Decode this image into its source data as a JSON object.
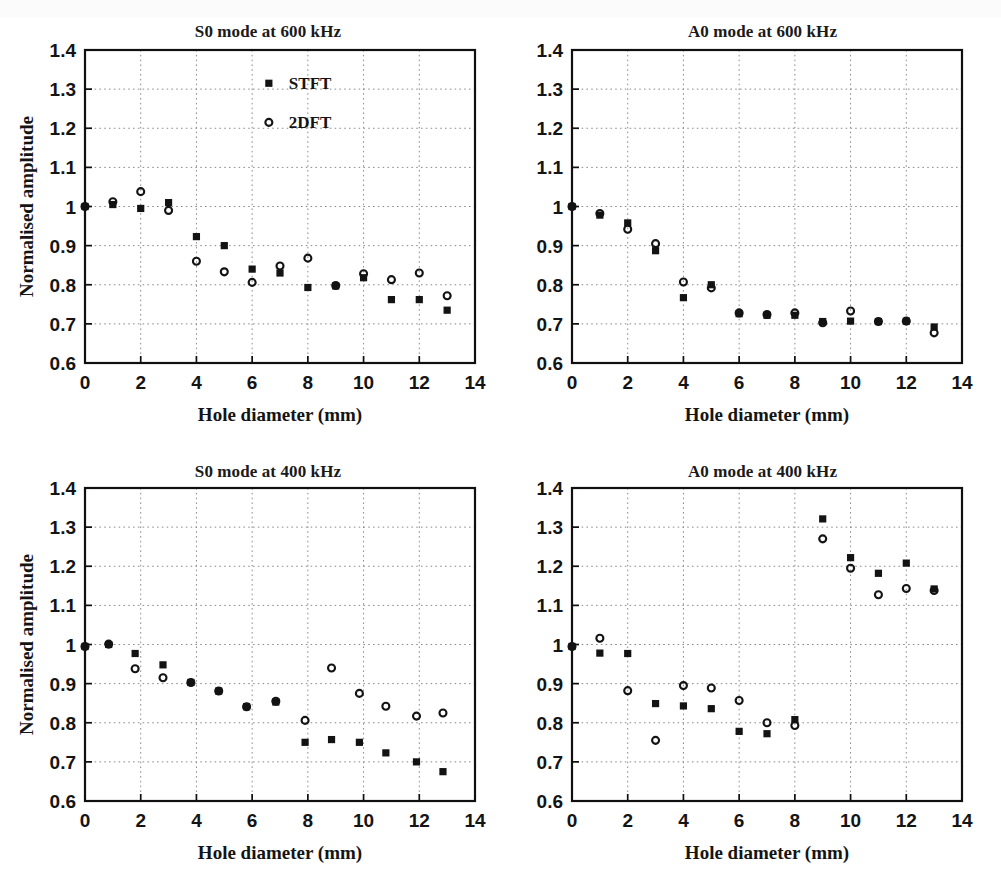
{
  "figure": {
    "axis_labels": {
      "x": "Hole diameter (mm)",
      "y": "Normalised amplitude"
    },
    "legend": {
      "stft": "STFT",
      "dft": "2DFT"
    },
    "xticks": [
      "0",
      "2",
      "4",
      "6",
      "8",
      "10",
      "12",
      "14"
    ],
    "yticks": [
      "0.6",
      "0.7",
      "0.8",
      "0.9",
      "1",
      "1.1",
      "1.2",
      "1.3",
      "1.4"
    ],
    "colors": {
      "ink": "#131313",
      "grid": "#8c8c8c",
      "background": "#ffffff"
    }
  },
  "chart_data": [
    {
      "type": "scatter",
      "panel": "top-left",
      "title": "S0 mode at 600 kHz",
      "xlabel": "Hole diameter (mm)",
      "ylabel": "Normalised amplitude",
      "xlim": [
        0,
        14
      ],
      "ylim": [
        0.6,
        1.4
      ],
      "xticks": [
        0,
        2,
        4,
        6,
        8,
        10,
        12,
        14
      ],
      "yticks": [
        0.6,
        0.7,
        0.8,
        0.9,
        1.0,
        1.1,
        1.2,
        1.3,
        1.4
      ],
      "grid": true,
      "legend_position": "top-right-inside",
      "series": [
        {
          "name": "STFT",
          "marker": "filled-square",
          "x": [
            0,
            1,
            2,
            3,
            4,
            5,
            6,
            7,
            8,
            9,
            10,
            11,
            12,
            13
          ],
          "y": [
            1.0,
            1.005,
            0.995,
            1.01,
            0.923,
            0.9,
            0.84,
            0.83,
            0.793,
            0.797,
            0.818,
            0.762,
            0.762,
            0.735
          ]
        },
        {
          "name": "2DFT",
          "marker": "open-circle",
          "x": [
            0,
            1,
            2,
            3,
            4,
            5,
            6,
            7,
            8,
            9,
            10,
            11,
            12,
            13
          ],
          "y": [
            1.0,
            1.012,
            1.038,
            0.99,
            0.86,
            0.833,
            0.806,
            0.848,
            0.868,
            0.798,
            0.828,
            0.813,
            0.83,
            0.772
          ]
        }
      ]
    },
    {
      "type": "scatter",
      "panel": "top-right",
      "title": "A0 mode at 600 kHz",
      "xlabel": "Hole diameter (mm)",
      "ylabel": "Normalised amplitude",
      "xlim": [
        0,
        14
      ],
      "ylim": [
        0.6,
        1.4
      ],
      "xticks": [
        0,
        2,
        4,
        6,
        8,
        10,
        12,
        14
      ],
      "yticks": [
        0.6,
        0.7,
        0.8,
        0.9,
        1.0,
        1.1,
        1.2,
        1.3,
        1.4
      ],
      "grid": true,
      "legend_position": "none",
      "series": [
        {
          "name": "STFT",
          "marker": "filled-square",
          "x": [
            0,
            1,
            2,
            3,
            4,
            5,
            6,
            7,
            8,
            9,
            10,
            11,
            12,
            13
          ],
          "y": [
            1.0,
            0.978,
            0.958,
            0.887,
            0.767,
            0.8,
            0.726,
            0.722,
            0.722,
            0.706,
            0.707,
            0.706,
            0.707,
            0.692
          ]
        },
        {
          "name": "2DFT",
          "marker": "open-circle",
          "x": [
            0,
            1,
            2,
            3,
            4,
            5,
            6,
            7,
            8,
            9,
            10,
            11,
            12,
            13
          ],
          "y": [
            1.0,
            0.982,
            0.942,
            0.905,
            0.807,
            0.792,
            0.728,
            0.724,
            0.728,
            0.703,
            0.733,
            0.706,
            0.707,
            0.677
          ]
        }
      ]
    },
    {
      "type": "scatter",
      "panel": "bottom-left",
      "title": "S0 mode at 400 kHz",
      "xlabel": "Hole diameter (mm)",
      "ylabel": "Normalised amplitude",
      "xlim": [
        0,
        14
      ],
      "ylim": [
        0.6,
        1.4
      ],
      "xticks": [
        0,
        2,
        4,
        6,
        8,
        10,
        12,
        14
      ],
      "yticks": [
        0.6,
        0.7,
        0.8,
        0.9,
        1.0,
        1.1,
        1.2,
        1.3,
        1.4
      ],
      "grid": true,
      "legend_position": "none",
      "series": [
        {
          "name": "STFT",
          "marker": "filled-square",
          "x": [
            0,
            0.85,
            1.8,
            2.8,
            3.8,
            4.8,
            5.8,
            6.85,
            7.9,
            8.85,
            9.85,
            10.8,
            11.9,
            12.85
          ],
          "y": [
            0.995,
            1.0,
            0.977,
            0.948,
            0.903,
            0.881,
            0.841,
            0.853,
            0.75,
            0.757,
            0.75,
            0.723,
            0.7,
            0.675
          ]
        },
        {
          "name": "2DFT",
          "marker": "open-circle",
          "x": [
            0,
            0.85,
            1.8,
            2.8,
            3.8,
            4.8,
            5.8,
            6.85,
            7.9,
            8.85,
            9.85,
            10.8,
            11.9,
            12.85
          ],
          "y": [
            0.995,
            1.001,
            0.938,
            0.915,
            0.903,
            0.881,
            0.841,
            0.855,
            0.806,
            0.94,
            0.875,
            0.842,
            0.817,
            0.825
          ]
        }
      ]
    },
    {
      "type": "scatter",
      "panel": "bottom-right",
      "title": "A0 mode at 400 kHz",
      "xlabel": "Hole diameter (mm)",
      "ylabel": "Normalised amplitude",
      "xlim": [
        0,
        14
      ],
      "ylim": [
        0.6,
        1.4
      ],
      "xticks": [
        0,
        2,
        4,
        6,
        8,
        10,
        12,
        14
      ],
      "yticks": [
        0.6,
        0.7,
        0.8,
        0.9,
        1.0,
        1.1,
        1.2,
        1.3,
        1.4
      ],
      "grid": true,
      "legend_position": "none",
      "series": [
        {
          "name": "STFT",
          "marker": "filled-square",
          "x": [
            0,
            1,
            2,
            3,
            4,
            5,
            6,
            7,
            8,
            9,
            10,
            11,
            12,
            13
          ],
          "y": [
            0.995,
            0.978,
            0.977,
            0.849,
            0.843,
            0.836,
            0.778,
            0.772,
            0.808,
            1.321,
            1.222,
            1.182,
            1.208,
            1.142
          ]
        },
        {
          "name": "2DFT",
          "marker": "open-circle",
          "x": [
            0,
            1,
            2,
            3,
            4,
            5,
            6,
            7,
            8,
            9,
            10,
            11,
            12,
            13
          ],
          "y": [
            0.995,
            1.016,
            0.882,
            0.755,
            0.895,
            0.889,
            0.857,
            0.8,
            0.793,
            1.27,
            1.195,
            1.127,
            1.143,
            1.138
          ]
        }
      ]
    }
  ]
}
